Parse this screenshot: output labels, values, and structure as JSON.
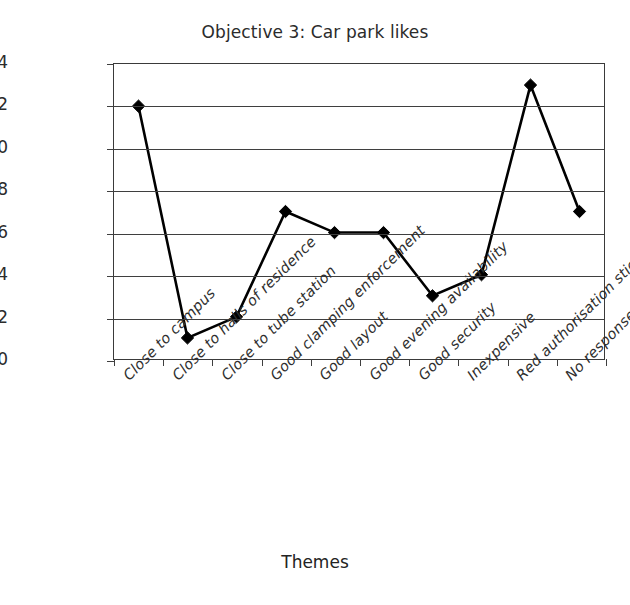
{
  "chart_data": {
    "type": "line",
    "title": "Objective 3: Car park likes",
    "xlabel": "Themes",
    "ylabel": "Number of comments",
    "categories": [
      "Close to campus",
      "Close to halls of residence",
      "Close to tube station",
      "Good clamping enforcement",
      "Good layout",
      "Good evening availability",
      "Good security",
      "Inexpensive",
      "Red authorisation sticker",
      "No response"
    ],
    "values": [
      12,
      1,
      2,
      7,
      6,
      6,
      3,
      4,
      13,
      7
    ],
    "ylim": [
      0,
      14
    ],
    "ytick_step": 2,
    "yticks": [
      "0",
      "2",
      "4",
      "6",
      "8",
      "10",
      "12",
      "14"
    ],
    "grid": "horizontal",
    "legend": "none",
    "marker": "diamond",
    "line_color": "#000000",
    "marker_color": "#000000",
    "grid_color": "#3f3f3f",
    "axis_color": "#3a3a3a",
    "background": "#ffffff"
  }
}
